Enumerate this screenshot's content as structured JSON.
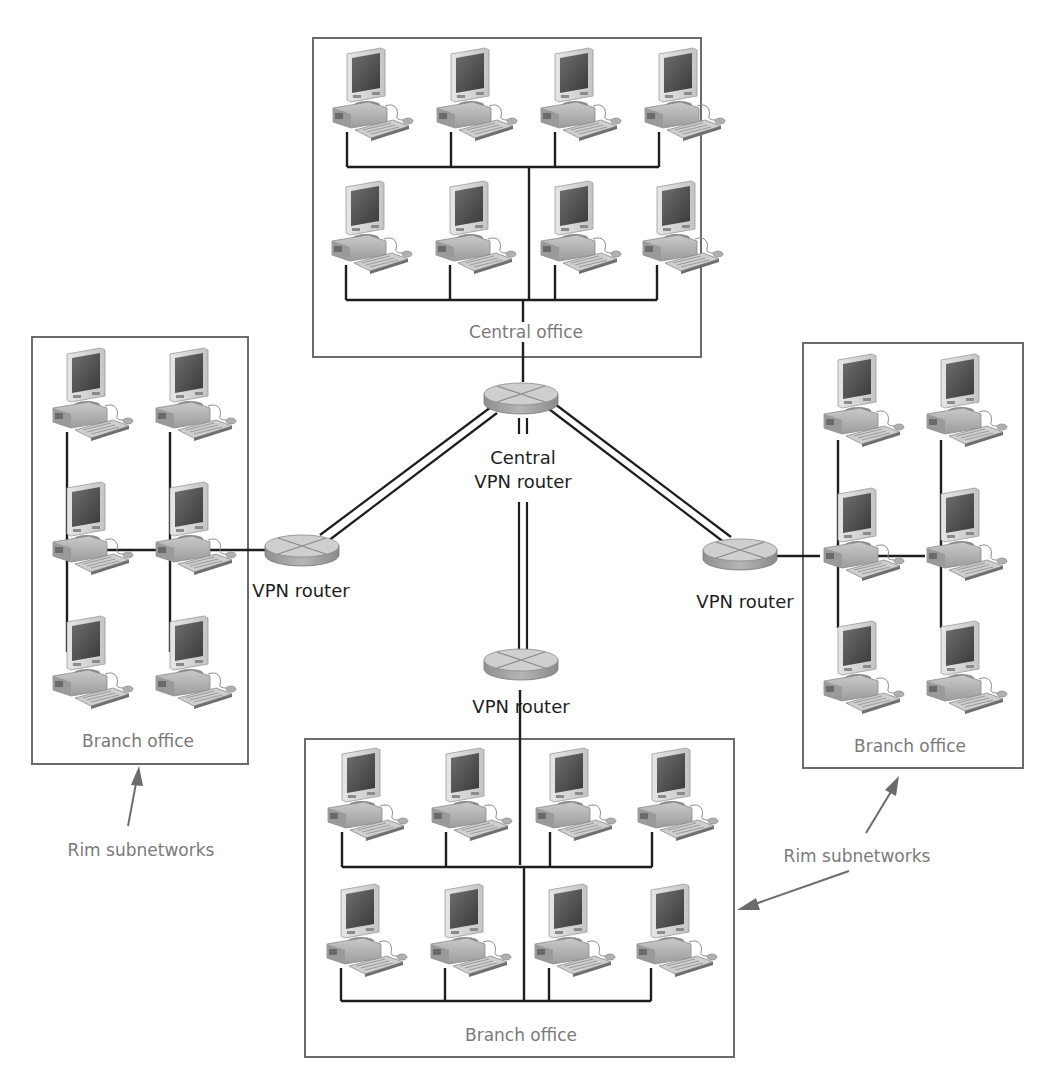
{
  "diagram": {
    "offices": [
      {
        "id": "central",
        "label": "Central office",
        "computers": 8,
        "layout": "2 rows x 4"
      },
      {
        "id": "branch_left",
        "label": "Branch office",
        "computers": 6,
        "layout": "3 rows x 2"
      },
      {
        "id": "branch_right",
        "label": "Branch office",
        "computers": 6,
        "layout": "3 rows x 2"
      },
      {
        "id": "branch_bottom",
        "label": "Branch office",
        "computers": 8,
        "layout": "2 rows x 4"
      }
    ],
    "routers": {
      "central": {
        "label_line1": "Central",
        "label_line2": "VPN router"
      },
      "left": {
        "label": "VPN router"
      },
      "right": {
        "label": "VPN router"
      },
      "bottom": {
        "label": "VPN router"
      }
    },
    "callouts": {
      "left": {
        "label": "Rim subnetworks"
      },
      "right": {
        "label": "Rim subnetworks"
      }
    },
    "colors": {
      "box_stroke": "#6b6b6b",
      "line": "#1e1e1e",
      "muted_text": "#7a7a7a",
      "router_top": "#cfcfcf",
      "router_side": "#9a9a9a"
    },
    "icons": {
      "computer": "desktop-computer-icon",
      "router": "router-icon"
    }
  }
}
